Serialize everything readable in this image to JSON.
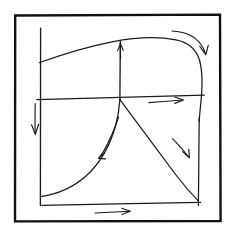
{
  "figure": {
    "title": "Hand-drawn phase portrait sketch",
    "description": "Hand-drawn diagram inside a rectangular frame showing a saddle-like flow field: an arched upper separatrix curve, a horizontal axis with rightward flow, a vertical axis with upward flow, a rising concave-up curve at lower left and a descending diagonal at lower right, with directional arrows on each branch.",
    "background_color": "#ffffff",
    "ink_color": "#1a1a1a",
    "frame_color": "#111111",
    "width": 236,
    "height": 239
  },
  "frame": {
    "name": "outer-border",
    "x": 14,
    "y": 14,
    "width": 207,
    "height": 208
  },
  "axes": {
    "vertical_left": {
      "label": "",
      "x": 40,
      "y_top": 28,
      "y_bottom": 205,
      "direction": "down"
    },
    "horizontal_mid": {
      "label": "",
      "x_left": 37,
      "x_right": 204,
      "y_left": 99,
      "y_right": 95,
      "direction": "right"
    },
    "vertical_center": {
      "label": "",
      "x": 120,
      "y_top": 41,
      "y_bottom": 99,
      "direction": "up"
    },
    "horizontal_bottom": {
      "label": "",
      "x_left": 42,
      "x_right": 200,
      "y_left": 205,
      "y_right": 202,
      "direction": "right"
    },
    "vertical_right": {
      "x": 199,
      "y_top": 60,
      "y_bottom": 205,
      "direction": "down"
    }
  },
  "curves": [
    {
      "name": "upper-separatrix-arc",
      "shape": "rising concave-down arc from left axis up over the top then bending sharply down at the right",
      "start": [
        40,
        62
      ],
      "apex": [
        140,
        38
      ],
      "end": [
        199,
        120
      ]
    },
    {
      "name": "lower-left-rising-curve",
      "shape": "concave-up curve rising from bottom-left toward the center node",
      "start": [
        41,
        196
      ],
      "end": [
        120,
        99
      ]
    },
    {
      "name": "lower-right-descending-line",
      "shape": "near-straight line descending from the center node to the bottom-right corner",
      "start": [
        120,
        99
      ],
      "end": [
        198,
        199
      ]
    }
  ],
  "arrows": [
    {
      "name": "arrow-left-axis-down",
      "direction": "down",
      "position": [
        35,
        113
      ],
      "on": "vertical_left"
    },
    {
      "name": "arrow-center-axis-up",
      "direction": "up",
      "position": [
        120,
        48
      ],
      "on": "vertical_center"
    },
    {
      "name": "arrow-mid-horizontal-right",
      "direction": "right",
      "position": [
        166,
        100
      ],
      "on": "horizontal_mid"
    },
    {
      "name": "arrow-bottom-horizontal-right",
      "direction": "right",
      "position": [
        112,
        212
      ],
      "on": "horizontal_bottom"
    },
    {
      "name": "arrow-upper-right-curved-down",
      "direction": "down-right curved",
      "position": [
        203,
        50
      ],
      "on": "upper-separatrix-arc"
    },
    {
      "name": "arrow-lower-left-down-left",
      "direction": "down-left",
      "position": [
        100,
        155
      ],
      "on": "lower-left-rising-curve"
    },
    {
      "name": "arrow-lower-right-down-right",
      "direction": "down-right",
      "position": [
        189,
        157
      ],
      "on": "lower-right-descending-line"
    }
  ],
  "nodes": [
    {
      "name": "center-saddle-node",
      "position": [
        120,
        99
      ],
      "label": ""
    }
  ],
  "annotations": []
}
